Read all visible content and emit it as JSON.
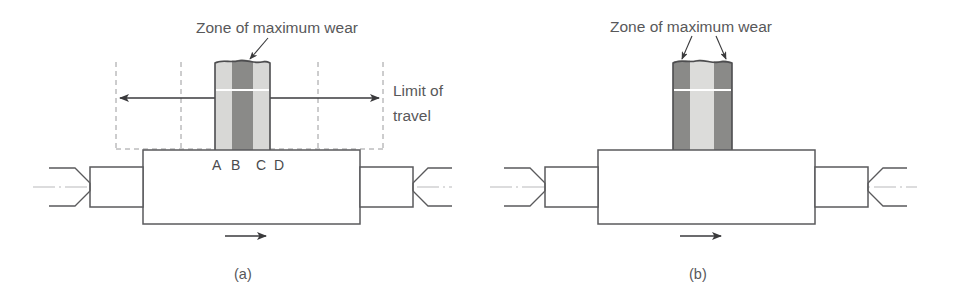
{
  "figure": {
    "caption_a": "(a)",
    "caption_b": "(b)"
  },
  "panel_a": {
    "zone_label": "Zone of maximum wear",
    "limit_label_line1": "Limit of",
    "limit_label_line2": "travel",
    "point_labels": [
      "A",
      "B",
      "C",
      "D"
    ],
    "block": {
      "bands": [
        {
          "name": "light-left",
          "color": "#d8d8d6"
        },
        {
          "name": "dark-center",
          "color": "#8a8a88"
        },
        {
          "name": "light-right",
          "color": "#d8d8d6"
        }
      ]
    },
    "arrows": {
      "left_travel": "left-arrow",
      "right_travel": "right-arrow",
      "rotation": "right-arrow"
    }
  },
  "panel_b": {
    "zone_label": "Zone of maximum wear",
    "block": {
      "bands": [
        {
          "name": "dark-left",
          "color": "#8a8a88"
        },
        {
          "name": "light-center",
          "color": "#dcdcda"
        },
        {
          "name": "dark-right",
          "color": "#8a8a88"
        }
      ]
    },
    "arrows": {
      "rotation": "right-arrow"
    }
  },
  "colors": {
    "line": "#5a5a5c",
    "text": "#58585a",
    "dark_band": "#8a8a88",
    "light_band": "#d8d8d6",
    "dashed": "#9a9a9c",
    "centerline": "#b9b9bb",
    "background": "#ffffff"
  }
}
